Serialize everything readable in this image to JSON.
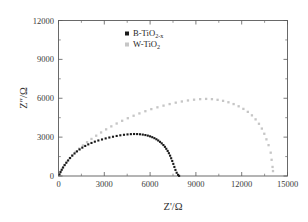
{
  "chart_data": {
    "type": "scatter",
    "title": "",
    "xlabel": "Z'/Ω",
    "ylabel": "Z″/Ω",
    "xlabel_main": "Z",
    "xlabel_prime": "'",
    "xlabel_unit": "/Ω",
    "ylabel_main": "Z",
    "ylabel_prime": "″",
    "ylabel_unit": "/Ω",
    "xlim": [
      0,
      15000
    ],
    "ylim": [
      0,
      12000
    ],
    "xticks": [
      0,
      3000,
      6000,
      9000,
      12000,
      15000
    ],
    "yticks": [
      0,
      3000,
      6000,
      9000,
      12000
    ],
    "xtick_labels": [
      "0",
      "3000",
      "6000",
      "9000",
      "12000",
      "15000"
    ],
    "ytick_labels": [
      "0",
      "3000",
      "6000",
      "9000",
      "12000"
    ],
    "minor_tick_interval": 1500,
    "grid": false,
    "legend_position": "top-center",
    "series": [
      {
        "name": "B-TiO2-x",
        "label_main": "B-TiO",
        "label_sub": "2-x",
        "marker": "filled-square",
        "color": "#1a1a1a",
        "marker_size": 2.1,
        "points": [
          [
            60,
            120
          ],
          [
            130,
            300
          ],
          [
            210,
            480
          ],
          [
            300,
            660
          ],
          [
            400,
            840
          ],
          [
            510,
            1020
          ],
          [
            630,
            1200
          ],
          [
            760,
            1390
          ],
          [
            900,
            1570
          ],
          [
            1050,
            1740
          ],
          [
            1210,
            1900
          ],
          [
            1380,
            2050
          ],
          [
            1560,
            2190
          ],
          [
            1750,
            2320
          ],
          [
            1950,
            2440
          ],
          [
            2160,
            2550
          ],
          [
            2380,
            2650
          ],
          [
            2610,
            2740
          ],
          [
            2850,
            2820
          ],
          [
            3090,
            2900
          ],
          [
            3330,
            2970
          ],
          [
            3570,
            3030
          ],
          [
            3810,
            3090
          ],
          [
            4050,
            3140
          ],
          [
            4290,
            3180
          ],
          [
            4520,
            3210
          ],
          [
            4740,
            3230
          ],
          [
            4950,
            3240
          ],
          [
            5150,
            3235
          ],
          [
            5340,
            3220
          ],
          [
            5520,
            3195
          ],
          [
            5690,
            3160
          ],
          [
            5850,
            3115
          ],
          [
            6000,
            3060
          ],
          [
            6140,
            2995
          ],
          [
            6280,
            2920
          ],
          [
            6410,
            2835
          ],
          [
            6530,
            2740
          ],
          [
            6650,
            2635
          ],
          [
            6760,
            2520
          ],
          [
            6870,
            2390
          ],
          [
            6970,
            2250
          ],
          [
            7060,
            2100
          ],
          [
            7150,
            1935
          ],
          [
            7230,
            1760
          ],
          [
            7310,
            1570
          ],
          [
            7380,
            1370
          ],
          [
            7450,
            1160
          ],
          [
            7520,
            935
          ],
          [
            7590,
            700
          ],
          [
            7660,
            470
          ],
          [
            7740,
            250
          ],
          [
            7830,
            90
          ],
          [
            7900,
            10
          ]
        ]
      },
      {
        "name": "W-TiO2",
        "label_main": "W-TiO",
        "label_sub": "2",
        "marker": "open-square",
        "color": "#c6c6c6",
        "marker_size": 2.3,
        "points": [
          [
            70,
            140
          ],
          [
            160,
            370
          ],
          [
            270,
            610
          ],
          [
            400,
            860
          ],
          [
            550,
            1110
          ],
          [
            720,
            1360
          ],
          [
            910,
            1610
          ],
          [
            1120,
            1860
          ],
          [
            1350,
            2110
          ],
          [
            1600,
            2360
          ],
          [
            1870,
            2610
          ],
          [
            2160,
            2860
          ],
          [
            2470,
            3110
          ],
          [
            2790,
            3360
          ],
          [
            3120,
            3600
          ],
          [
            3460,
            3830
          ],
          [
            3810,
            4050
          ],
          [
            4170,
            4260
          ],
          [
            4540,
            4460
          ],
          [
            4920,
            4650
          ],
          [
            5300,
            4830
          ],
          [
            5690,
            5000
          ],
          [
            6080,
            5160
          ],
          [
            6480,
            5300
          ],
          [
            6880,
            5430
          ],
          [
            7280,
            5550
          ],
          [
            7680,
            5660
          ],
          [
            8080,
            5750
          ],
          [
            8480,
            5830
          ],
          [
            8880,
            5890
          ],
          [
            9280,
            5930
          ],
          [
            9670,
            5950
          ],
          [
            10050,
            5930
          ],
          [
            10420,
            5880
          ],
          [
            10780,
            5800
          ],
          [
            11130,
            5690
          ],
          [
            11470,
            5550
          ],
          [
            11800,
            5380
          ],
          [
            12110,
            5180
          ],
          [
            12400,
            4950
          ],
          [
            12670,
            4680
          ],
          [
            12910,
            4370
          ],
          [
            13130,
            4030
          ],
          [
            13320,
            3660
          ],
          [
            13480,
            3260
          ],
          [
            13620,
            2830
          ],
          [
            13760,
            2380
          ],
          [
            13900,
            1800
          ],
          [
            13960,
            1250
          ],
          [
            14020,
            700
          ],
          [
            14050,
            380
          ]
        ]
      }
    ]
  },
  "legend": {
    "items": [
      {
        "marker": "filled-square",
        "color": "#1a1a1a",
        "main": "B-TiO",
        "sub": "2-x"
      },
      {
        "marker": "open-square",
        "color": "#c6c6c6",
        "main": "W-TiO",
        "sub": "2"
      }
    ]
  }
}
